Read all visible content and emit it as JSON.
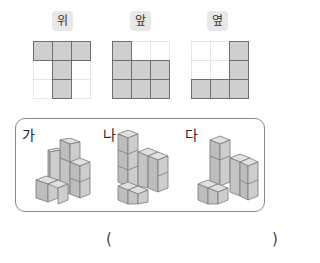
{
  "views": [
    {
      "label": "위",
      "cells": [
        [
          1,
          1,
          1
        ],
        [
          0,
          1,
          0
        ],
        [
          0,
          1,
          0
        ]
      ]
    },
    {
      "label": "앞",
      "cells": [
        [
          1,
          0,
          0
        ],
        [
          1,
          1,
          1
        ],
        [
          1,
          1,
          1
        ]
      ]
    },
    {
      "label": "옆",
      "cells": [
        [
          0,
          0,
          1
        ],
        [
          0,
          0,
          1
        ],
        [
          1,
          1,
          1
        ]
      ]
    }
  ],
  "options": [
    {
      "label": "가"
    },
    {
      "label": "나"
    },
    {
      "label": "다"
    }
  ],
  "answer": {
    "open": "(",
    "close": ")",
    "value": ""
  },
  "colors": {
    "cell_fill": "#cfcfcf",
    "cell_border": "#6e6e6e",
    "grid_dotted": "#cccccc",
    "label_bg": "#e8e8e8"
  }
}
